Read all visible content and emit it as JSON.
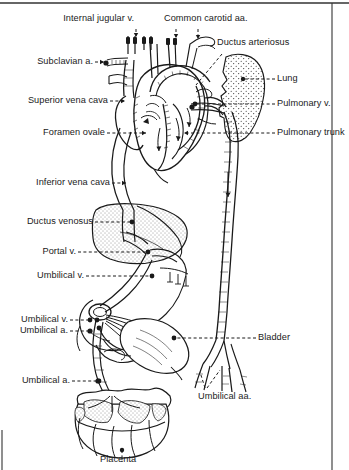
{
  "figure": {
    "border_color": "#333333",
    "ink_color": "#1a1a1a",
    "background": "#ffffff",
    "width": 349,
    "height": 470
  },
  "labels": {
    "internal_jugular_v": "Internal jugular v.",
    "common_carotid_aa": "Common carotid aa.",
    "ductus_arteriosus": "Ductus arteriosus",
    "subclavian_a": "Subclavian a.",
    "lung": "Lung",
    "superior_vena_cava": "Superior vena cava",
    "pulmonary_v": "Pulmonary v.",
    "foramen_ovale": "Foramen ovale",
    "pulmonary_trunk": "Pulmonary trunk",
    "inferior_vena_cava": "Inferior vena cava",
    "ductus_venosus": "Ductus venosus",
    "portal_v": "Portal v.",
    "umbilical_v": "Umbilical v.",
    "umbilical_v_2": "Umbilical v.",
    "umbilical_a": "Umbilical a.",
    "bladder": "Bladder",
    "umbilical_a_2": "Umbilical a.",
    "umbilical_aa": "Umbilical aa.",
    "placenta": "Placenta"
  }
}
